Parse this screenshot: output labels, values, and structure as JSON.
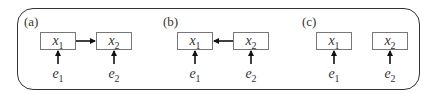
{
  "panels": [
    {
      "label": "(a)",
      "nodes": [
        {
          "var": "x",
          "sub": "1"
        },
        {
          "var": "x",
          "sub": "2"
        }
      ],
      "errors": [
        {
          "var": "e",
          "sub": "1"
        },
        {
          "var": "e",
          "sub": "2"
        }
      ],
      "edge": "x1 -> x2"
    },
    {
      "label": "(b)",
      "nodes": [
        {
          "var": "x",
          "sub": "1"
        },
        {
          "var": "x",
          "sub": "2"
        }
      ],
      "errors": [
        {
          "var": "e",
          "sub": "1"
        },
        {
          "var": "e",
          "sub": "2"
        }
      ],
      "edge": "x2 -> x1"
    },
    {
      "label": "(c)",
      "nodes": [
        {
          "var": "x",
          "sub": "1"
        },
        {
          "var": "x",
          "sub": "2"
        }
      ],
      "errors": [
        {
          "var": "e",
          "sub": "1"
        },
        {
          "var": "e",
          "sub": "2"
        }
      ],
      "edge": "none"
    }
  ],
  "colors": {
    "stroke": "#333333",
    "box_border": "#777777",
    "arrow": "#111111"
  }
}
